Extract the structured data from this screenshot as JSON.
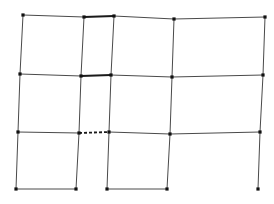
{
  "diagram": {
    "type": "planar-grid-graph",
    "width": 274,
    "height": 204,
    "colors": {
      "line": "#4a4a4a",
      "thick_line": "#1a1a1a",
      "node": "#111111",
      "background": "#ffffff"
    },
    "nodes": [
      {
        "id": "r0c0",
        "x": 23,
        "y": 15
      },
      {
        "id": "r0c1",
        "x": 84,
        "y": 17
      },
      {
        "id": "r0c2",
        "x": 114,
        "y": 16
      },
      {
        "id": "r0c3",
        "x": 174,
        "y": 19
      },
      {
        "id": "r0c4",
        "x": 265,
        "y": 17
      },
      {
        "id": "r1c0",
        "x": 20,
        "y": 74
      },
      {
        "id": "r1c1",
        "x": 81,
        "y": 76
      },
      {
        "id": "r1c2",
        "x": 111,
        "y": 75
      },
      {
        "id": "r1c3",
        "x": 172,
        "y": 77
      },
      {
        "id": "r1c4",
        "x": 263,
        "y": 75
      },
      {
        "id": "r2c0",
        "x": 18,
        "y": 132
      },
      {
        "id": "r2c1",
        "x": 79,
        "y": 133
      },
      {
        "id": "r2c2",
        "x": 109,
        "y": 132
      },
      {
        "id": "r2c3",
        "x": 170,
        "y": 134
      },
      {
        "id": "r2c4",
        "x": 260,
        "y": 132
      },
      {
        "id": "r3c0",
        "x": 16,
        "y": 189
      },
      {
        "id": "r3c1",
        "x": 76,
        "y": 189
      },
      {
        "id": "r3c2",
        "x": 107,
        "y": 189
      },
      {
        "id": "r3c3",
        "x": 167,
        "y": 189
      },
      {
        "id": "r3c4",
        "x": 258,
        "y": 189
      }
    ],
    "edges": [
      {
        "from": "r0c0",
        "to": "r0c1",
        "style": "solid"
      },
      {
        "from": "r0c1",
        "to": "r0c2",
        "style": "thick"
      },
      {
        "from": "r0c2",
        "to": "r0c3",
        "style": "solid"
      },
      {
        "from": "r0c3",
        "to": "r0c4",
        "style": "solid"
      },
      {
        "from": "r1c0",
        "to": "r1c1",
        "style": "solid"
      },
      {
        "from": "r1c1",
        "to": "r1c2",
        "style": "thick"
      },
      {
        "from": "r1c2",
        "to": "r1c3",
        "style": "solid"
      },
      {
        "from": "r1c3",
        "to": "r1c4",
        "style": "solid"
      },
      {
        "from": "r2c0",
        "to": "r2c1",
        "style": "solid"
      },
      {
        "from": "r2c1",
        "to": "r2c2",
        "style": "dashed"
      },
      {
        "from": "r2c2",
        "to": "r2c3",
        "style": "solid"
      },
      {
        "from": "r2c3",
        "to": "r2c4",
        "style": "solid"
      },
      {
        "from": "r3c0",
        "to": "r3c1",
        "style": "solid"
      },
      {
        "from": "r3c2",
        "to": "r3c3",
        "style": "solid"
      },
      {
        "from": "r0c0",
        "to": "r1c0",
        "style": "solid"
      },
      {
        "from": "r1c0",
        "to": "r2c0",
        "style": "solid"
      },
      {
        "from": "r2c0",
        "to": "r3c0",
        "style": "solid"
      },
      {
        "from": "r0c1",
        "to": "r1c1",
        "style": "solid"
      },
      {
        "from": "r1c1",
        "to": "r2c1",
        "style": "solid"
      },
      {
        "from": "r2c1",
        "to": "r3c1",
        "style": "solid"
      },
      {
        "from": "r0c2",
        "to": "r1c2",
        "style": "solid"
      },
      {
        "from": "r1c2",
        "to": "r2c2",
        "style": "solid"
      },
      {
        "from": "r2c2",
        "to": "r3c2",
        "style": "solid"
      },
      {
        "from": "r0c3",
        "to": "r1c3",
        "style": "solid"
      },
      {
        "from": "r1c3",
        "to": "r2c3",
        "style": "solid"
      },
      {
        "from": "r2c3",
        "to": "r3c3",
        "style": "solid"
      },
      {
        "from": "r0c4",
        "to": "r1c4",
        "style": "solid"
      },
      {
        "from": "r1c4",
        "to": "r2c4",
        "style": "solid"
      },
      {
        "from": "r2c4",
        "to": "r3c4",
        "style": "solid"
      }
    ]
  }
}
